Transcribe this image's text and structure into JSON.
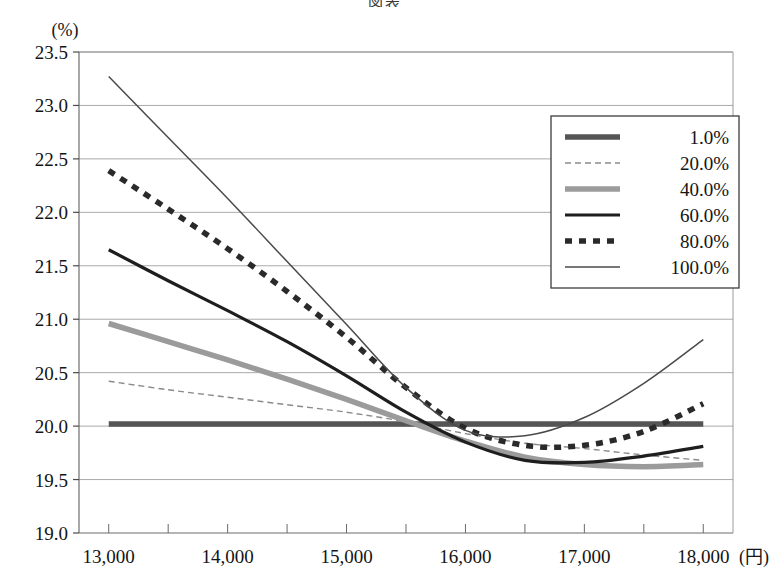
{
  "figure": {
    "title_fragment": "図表",
    "y_unit_label": "(%)",
    "x_unit_label": "(円)"
  },
  "chart_data": {
    "type": "line",
    "title": "",
    "xlabel": "(円)",
    "ylabel": "(%)",
    "xlim": [
      12750,
      18250
    ],
    "ylim": [
      19.0,
      23.5
    ],
    "grid": true,
    "legend_position": "upper-right",
    "x_tick_labels": [
      "13,000",
      "14,000",
      "15,000",
      "16,000",
      "17,000",
      "18,000"
    ],
    "x_tick_values": [
      13000,
      14000,
      15000,
      16000,
      17000,
      18000
    ],
    "x_minor_tick_values": [
      13500,
      14500,
      15500,
      16500,
      17500
    ],
    "y_tick_labels": [
      "19.0",
      "19.5",
      "20.0",
      "20.5",
      "21.0",
      "21.5",
      "22.0",
      "22.5",
      "23.0",
      "23.5"
    ],
    "y_tick_values": [
      19.0,
      19.5,
      20.0,
      20.5,
      21.0,
      21.5,
      22.0,
      22.5,
      23.0,
      23.5
    ],
    "x": [
      13000,
      13500,
      14000,
      14500,
      15000,
      15500,
      16000,
      16500,
      17000,
      17500,
      18000
    ],
    "series": [
      {
        "name": "1.0%",
        "color": "#555555",
        "width": 5.5,
        "dash": "none",
        "values": [
          20.02,
          20.02,
          20.02,
          20.02,
          20.02,
          20.02,
          20.02,
          20.02,
          20.02,
          20.02,
          20.02
        ]
      },
      {
        "name": "20.0%",
        "color": "#8a8a8a",
        "width": 1.4,
        "dash": "6,4",
        "values": [
          20.42,
          20.34,
          20.27,
          20.2,
          20.13,
          20.04,
          19.93,
          19.84,
          19.79,
          19.73,
          19.68
        ]
      },
      {
        "name": "40.0%",
        "color": "#9b9b9b",
        "width": 5.5,
        "dash": "none",
        "values": [
          20.96,
          20.79,
          20.62,
          20.44,
          20.25,
          20.05,
          19.86,
          19.71,
          19.64,
          19.62,
          19.64
        ]
      },
      {
        "name": "60.0%",
        "color": "#1e1e1e",
        "width": 3.2,
        "dash": "none",
        "values": [
          21.65,
          21.36,
          21.08,
          20.79,
          20.47,
          20.13,
          19.85,
          19.68,
          19.66,
          19.72,
          19.81
        ]
      },
      {
        "name": "80.0%",
        "color": "#2a2a2a",
        "width": 5.5,
        "dash": "7,7",
        "values": [
          22.39,
          22.03,
          21.66,
          21.26,
          20.83,
          20.36,
          19.98,
          19.82,
          19.82,
          19.95,
          20.21
        ]
      },
      {
        "name": "100.0%",
        "color": "#4a4a4a",
        "width": 1.5,
        "dash": "none",
        "values": [
          23.27,
          22.7,
          22.13,
          21.54,
          20.95,
          20.36,
          19.96,
          19.91,
          20.08,
          20.4,
          20.81
        ]
      }
    ]
  },
  "legend": {
    "items": [
      {
        "label": "1.0%"
      },
      {
        "label": "20.0%"
      },
      {
        "label": "40.0%"
      },
      {
        "label": "60.0%"
      },
      {
        "label": "80.0%"
      },
      {
        "label": "100.0%"
      }
    ]
  }
}
